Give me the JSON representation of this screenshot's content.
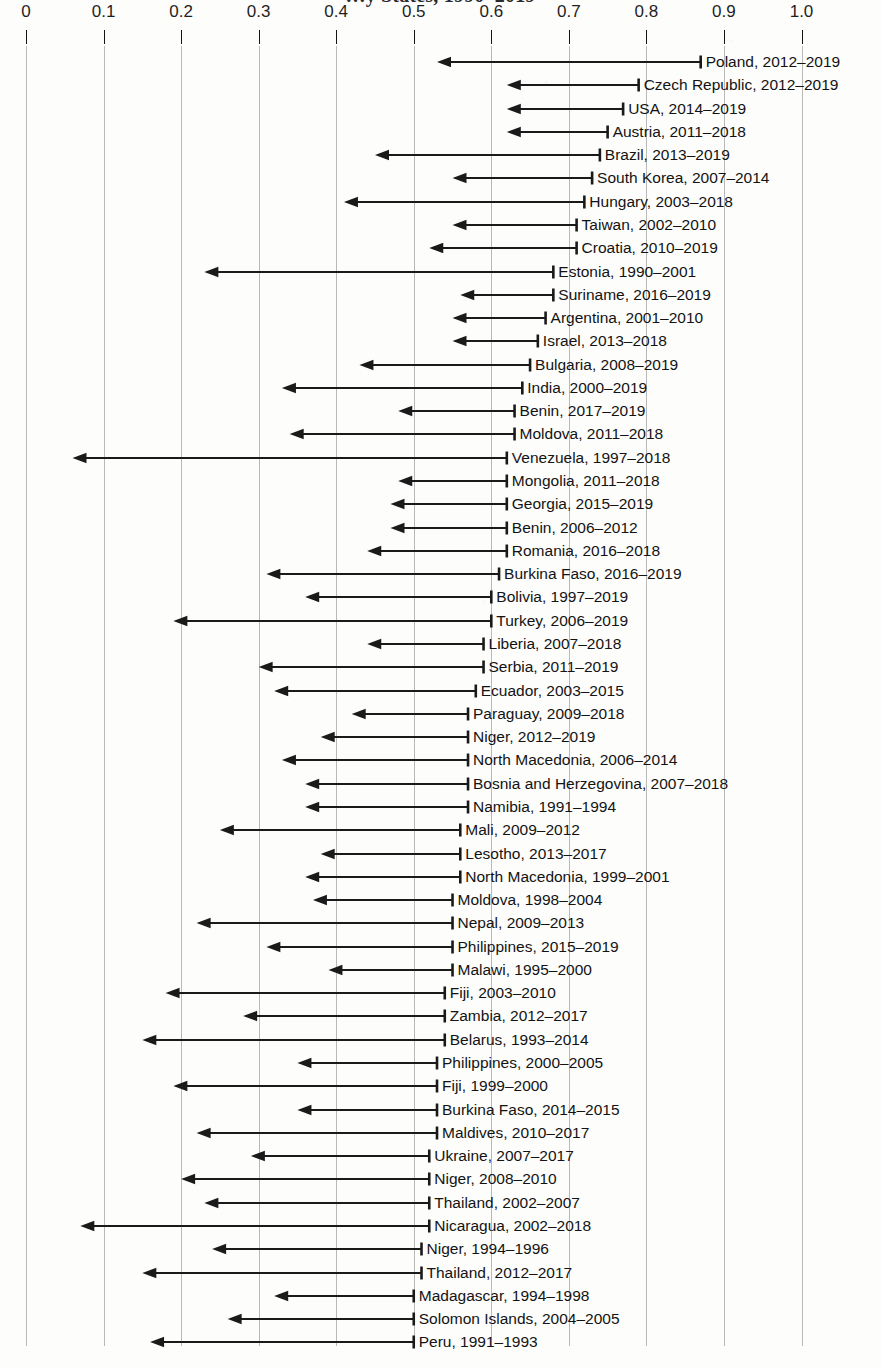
{
  "chart_title": "…y States, 1990–2019",
  "axis": {
    "label": "",
    "ticks": [
      "0",
      "0.1",
      "0.2",
      "0.3",
      "0.4",
      "0.5",
      "0.6",
      "0.7",
      "0.8",
      "0.9",
      "1.0"
    ],
    "tick_values": [
      0,
      0.1,
      0.2,
      0.3,
      0.4,
      0.5,
      0.6,
      0.7,
      0.8,
      0.9,
      1.0
    ],
    "min": 0,
    "max": 1.0,
    "position": "top",
    "grid": true
  },
  "colors": {
    "arrow": "#1a1a1a",
    "gridline": "#b9b9b9",
    "text": "#131313",
    "background": "#fdfdfc"
  },
  "chart_data": {
    "type": "bar",
    "title": "…y States, 1990–2019",
    "xlabel": "",
    "ylabel": "",
    "xlim": [
      0,
      1.0
    ],
    "grid": true,
    "legend": "none",
    "orientation": "horizontal",
    "note": "Each row is a left-pointing arrow: tail at the start value (right) and head at the end value (left), showing a decline over the labelled period.",
    "categories": [
      "Poland, 2012–2019",
      "Czech Republic, 2012–2019",
      "USA, 2014–2019",
      "Austria, 2011–2018",
      "Brazil, 2013–2019",
      "South Korea, 2007–2014",
      "Hungary, 2003–2018",
      "Taiwan, 2002–2010",
      "Croatia, 2010–2019",
      "Estonia, 1990–2001",
      "Suriname, 2016–2019",
      "Argentina, 2001–2010",
      "Israel, 2013–2018",
      "Bulgaria, 2008–2019",
      "India, 2000–2019",
      "Benin, 2017–2019",
      "Moldova, 2011–2018",
      "Venezuela, 1997–2018",
      "Mongolia, 2011–2018",
      "Georgia, 2015–2019",
      "Benin, 2006–2012",
      "Romania, 2016–2018",
      "Burkina Faso, 2016–2019",
      "Bolivia, 1997–2019",
      "Turkey, 2006–2019",
      "Liberia, 2007–2018",
      "Serbia, 2011–2019",
      "Ecuador, 2003–2015",
      "Paraguay, 2009–2018",
      "Niger, 2012–2019",
      "North Macedonia, 2006–2014",
      "Bosnia and Herzegovina, 2007–2018",
      "Namibia, 1991–1994",
      "Mali, 2009–2012",
      "Lesotho, 2013–2017",
      "North Macedonia, 1999–2001",
      "Moldova, 1998–2004",
      "Nepal, 2009–2013",
      "Philippines, 2015–2019",
      "Malawi, 1995–2000",
      "Fiji, 2003–2010",
      "Zambia, 2012–2017",
      "Belarus, 1993–2014",
      "Philippines, 2000–2005",
      "Fiji, 1999–2000",
      "Burkina Faso, 2014–2015",
      "Maldives, 2010–2017",
      "Ukraine, 2007–2017",
      "Niger, 2008–2010",
      "Thailand, 2002–2007",
      "Nicaragua, 2002–2018",
      "Niger, 1994–1996",
      "Thailand, 2012–2017",
      "Madagascar, 1994–1998",
      "Solomon Islands, 2004–2005",
      "Peru, 1991–1993"
    ],
    "series": [
      {
        "name": "start value",
        "values": [
          0.87,
          0.79,
          0.77,
          0.75,
          0.74,
          0.73,
          0.72,
          0.71,
          0.71,
          0.68,
          0.68,
          0.67,
          0.66,
          0.65,
          0.64,
          0.63,
          0.63,
          0.62,
          0.62,
          0.62,
          0.62,
          0.62,
          0.61,
          0.6,
          0.6,
          0.59,
          0.59,
          0.58,
          0.57,
          0.57,
          0.57,
          0.57,
          0.57,
          0.56,
          0.56,
          0.56,
          0.55,
          0.55,
          0.55,
          0.55,
          0.54,
          0.54,
          0.54,
          0.53,
          0.53,
          0.53,
          0.53,
          0.52,
          0.52,
          0.52,
          0.52,
          0.51,
          0.51,
          0.5,
          0.5,
          0.5
        ]
      },
      {
        "name": "end value",
        "values": [
          0.53,
          0.62,
          0.62,
          0.62,
          0.45,
          0.55,
          0.41,
          0.55,
          0.52,
          0.23,
          0.56,
          0.55,
          0.55,
          0.43,
          0.33,
          0.48,
          0.34,
          0.06,
          0.48,
          0.47,
          0.47,
          0.44,
          0.31,
          0.36,
          0.19,
          0.44,
          0.3,
          0.32,
          0.42,
          0.38,
          0.33,
          0.36,
          0.36,
          0.25,
          0.38,
          0.36,
          0.37,
          0.22,
          0.31,
          0.39,
          0.18,
          0.28,
          0.15,
          0.35,
          0.19,
          0.35,
          0.22,
          0.29,
          0.2,
          0.23,
          0.07,
          0.24,
          0.15,
          0.32,
          0.26,
          0.16
        ]
      }
    ]
  },
  "rows": [
    {
      "label": "Poland, 2012–2019",
      "start": 0.87,
      "end": 0.53
    },
    {
      "label": "Czech Republic, 2012–2019",
      "start": 0.79,
      "end": 0.62
    },
    {
      "label": "USA, 2014–2019",
      "start": 0.77,
      "end": 0.62
    },
    {
      "label": "Austria, 2011–2018",
      "start": 0.75,
      "end": 0.62
    },
    {
      "label": "Brazil, 2013–2019",
      "start": 0.74,
      "end": 0.45
    },
    {
      "label": "South Korea, 2007–2014",
      "start": 0.73,
      "end": 0.55
    },
    {
      "label": "Hungary, 2003–2018",
      "start": 0.72,
      "end": 0.41
    },
    {
      "label": "Taiwan, 2002–2010",
      "start": 0.71,
      "end": 0.55
    },
    {
      "label": "Croatia, 2010–2019",
      "start": 0.71,
      "end": 0.52
    },
    {
      "label": "Estonia, 1990–2001",
      "start": 0.68,
      "end": 0.23
    },
    {
      "label": "Suriname, 2016–2019",
      "start": 0.68,
      "end": 0.56
    },
    {
      "label": "Argentina, 2001–2010",
      "start": 0.67,
      "end": 0.55
    },
    {
      "label": "Israel, 2013–2018",
      "start": 0.66,
      "end": 0.55
    },
    {
      "label": "Bulgaria, 2008–2019",
      "start": 0.65,
      "end": 0.43
    },
    {
      "label": "India, 2000–2019",
      "start": 0.64,
      "end": 0.33
    },
    {
      "label": "Benin, 2017–2019",
      "start": 0.63,
      "end": 0.48
    },
    {
      "label": "Moldova, 2011–2018",
      "start": 0.63,
      "end": 0.34
    },
    {
      "label": "Venezuela, 1997–2018",
      "start": 0.62,
      "end": 0.06
    },
    {
      "label": "Mongolia, 2011–2018",
      "start": 0.62,
      "end": 0.48
    },
    {
      "label": "Georgia, 2015–2019",
      "start": 0.62,
      "end": 0.47
    },
    {
      "label": "Benin, 2006–2012",
      "start": 0.62,
      "end": 0.47
    },
    {
      "label": "Romania, 2016–2018",
      "start": 0.62,
      "end": 0.44
    },
    {
      "label": "Burkina Faso, 2016–2019",
      "start": 0.61,
      "end": 0.31
    },
    {
      "label": "Bolivia, 1997–2019",
      "start": 0.6,
      "end": 0.36
    },
    {
      "label": "Turkey, 2006–2019",
      "start": 0.6,
      "end": 0.19
    },
    {
      "label": "Liberia, 2007–2018",
      "start": 0.59,
      "end": 0.44
    },
    {
      "label": "Serbia, 2011–2019",
      "start": 0.59,
      "end": 0.3
    },
    {
      "label": "Ecuador, 2003–2015",
      "start": 0.58,
      "end": 0.32
    },
    {
      "label": "Paraguay, 2009–2018",
      "start": 0.57,
      "end": 0.42
    },
    {
      "label": "Niger, 2012–2019",
      "start": 0.57,
      "end": 0.38
    },
    {
      "label": "North Macedonia, 2006–2014",
      "start": 0.57,
      "end": 0.33
    },
    {
      "label": "Bosnia and Herzegovina, 2007–2018",
      "start": 0.57,
      "end": 0.36
    },
    {
      "label": "Namibia, 1991–1994",
      "start": 0.57,
      "end": 0.36
    },
    {
      "label": "Mali, 2009–2012",
      "start": 0.56,
      "end": 0.25
    },
    {
      "label": "Lesotho, 2013–2017",
      "start": 0.56,
      "end": 0.38
    },
    {
      "label": "North Macedonia, 1999–2001",
      "start": 0.56,
      "end": 0.36
    },
    {
      "label": "Moldova, 1998–2004",
      "start": 0.55,
      "end": 0.37
    },
    {
      "label": "Nepal, 2009–2013",
      "start": 0.55,
      "end": 0.22
    },
    {
      "label": "Philippines, 2015–2019",
      "start": 0.55,
      "end": 0.31
    },
    {
      "label": "Malawi, 1995–2000",
      "start": 0.55,
      "end": 0.39
    },
    {
      "label": "Fiji, 2003–2010",
      "start": 0.54,
      "end": 0.18
    },
    {
      "label": "Zambia, 2012–2017",
      "start": 0.54,
      "end": 0.28
    },
    {
      "label": "Belarus, 1993–2014",
      "start": 0.54,
      "end": 0.15
    },
    {
      "label": "Philippines, 2000–2005",
      "start": 0.53,
      "end": 0.35
    },
    {
      "label": "Fiji, 1999–2000",
      "start": 0.53,
      "end": 0.19
    },
    {
      "label": "Burkina Faso, 2014–2015",
      "start": 0.53,
      "end": 0.35
    },
    {
      "label": "Maldives, 2010–2017",
      "start": 0.53,
      "end": 0.22
    },
    {
      "label": "Ukraine, 2007–2017",
      "start": 0.52,
      "end": 0.29
    },
    {
      "label": "Niger, 2008–2010",
      "start": 0.52,
      "end": 0.2
    },
    {
      "label": "Thailand, 2002–2007",
      "start": 0.52,
      "end": 0.23
    },
    {
      "label": "Nicaragua, 2002–2018",
      "start": 0.52,
      "end": 0.07
    },
    {
      "label": "Niger, 1994–1996",
      "start": 0.51,
      "end": 0.24
    },
    {
      "label": "Thailand, 2012–2017",
      "start": 0.51,
      "end": 0.15
    },
    {
      "label": "Madagascar, 1994–1998",
      "start": 0.5,
      "end": 0.32
    },
    {
      "label": "Solomon Islands, 2004–2005",
      "start": 0.5,
      "end": 0.26
    },
    {
      "label": "Peru, 1991–1993",
      "start": 0.5,
      "end": 0.16
    }
  ]
}
